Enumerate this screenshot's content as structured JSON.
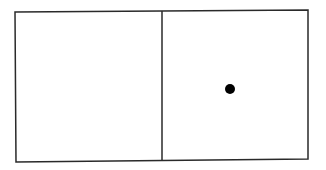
{
  "diagram": {
    "type": "two-panel-box",
    "colors": {
      "background": "#ffffff",
      "stroke": "#2a2a2a",
      "dot": "#000000"
    },
    "outer_box": {
      "top_left": [
        15,
        12
      ],
      "top_right": [
        308,
        10
      ],
      "bottom_right": [
        308,
        159
      ],
      "bottom_left": [
        16,
        162
      ],
      "stroke_width": 1.5
    },
    "divider": {
      "top": [
        162,
        11
      ],
      "bottom": [
        162,
        160
      ]
    },
    "panels": [
      {
        "name": "left-panel",
        "contents": []
      },
      {
        "name": "right-panel",
        "contents": [
          {
            "kind": "dot",
            "cx": 230,
            "cy": 89,
            "r": 5
          }
        ]
      }
    ]
  }
}
